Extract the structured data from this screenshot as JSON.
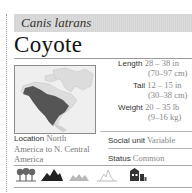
{
  "species": {
    "scientific_name": "Canis latrans",
    "common_name": "Coyote"
  },
  "map": {
    "alt": "range-map-north-america",
    "range_color": "#555555",
    "land_color": "#dcdcdc"
  },
  "stats": {
    "length": {
      "label": "Length",
      "value": "28 – 38 in",
      "sub": "(70–97 cm)"
    },
    "tail": {
      "label": "Tail",
      "value": "12 – 15 in",
      "sub": "(30–38 cm)"
    },
    "weight": {
      "label": "Weight",
      "value": "20 – 35 lb",
      "sub": "(9–16 kg)"
    }
  },
  "location": {
    "label": "Location",
    "value": "North America to N. Central America"
  },
  "social_unit": {
    "label": "Social unit",
    "value": "Variable"
  },
  "status": {
    "label": "Status",
    "value": "Common"
  },
  "habitats": [
    {
      "name": "forest-icon",
      "active": true
    },
    {
      "name": "mountain-icon",
      "active": true
    },
    {
      "name": "grassland-icon",
      "active": false
    },
    {
      "name": "desert-icon",
      "active": false
    },
    {
      "name": "urban-icon",
      "active": true
    }
  ]
}
